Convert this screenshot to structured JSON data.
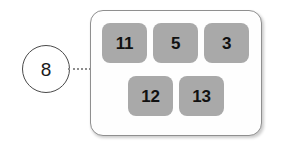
{
  "callout": {
    "number": "8",
    "connector": "dotted-leader-line"
  },
  "panel": {
    "rows": [
      {
        "name": "top-row",
        "tiles": [
          {
            "label": "11"
          },
          {
            "label": "5"
          },
          {
            "label": "3"
          }
        ]
      },
      {
        "name": "bottom-row",
        "tiles": [
          {
            "label": "12"
          },
          {
            "label": "13"
          }
        ]
      }
    ]
  },
  "colors": {
    "tile_fill": "#a9a9a9",
    "panel_fill": "#fefefe",
    "panel_border": "#8f8f8f",
    "circle_border": "#4a4a4a",
    "text": "#111111",
    "leader": "#8c8c8c"
  }
}
